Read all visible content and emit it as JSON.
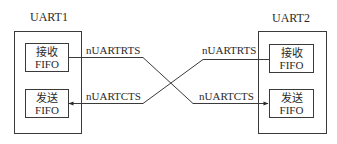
{
  "uart1": {
    "title": "UART1",
    "receive_fifo": {
      "line1": "接收",
      "line2": "FIFO"
    },
    "transmit_fifo": {
      "line1": "发送",
      "line2": "FIFO"
    }
  },
  "uart2": {
    "title": "UART2",
    "receive_fifo": {
      "line1": "接收",
      "line2": "FIFO"
    },
    "transmit_fifo": {
      "line1": "发送",
      "line2": "FIFO"
    }
  },
  "signals": {
    "uart1_rts": "nUARTRTS",
    "uart1_cts": "nUARTCTS",
    "uart2_rts": "nUARTRTS",
    "uart2_cts": "nUARTCTS"
  },
  "colors": {
    "line": "#3a3a3a",
    "text": "#2a2a2a",
    "background": "#ffffff"
  }
}
